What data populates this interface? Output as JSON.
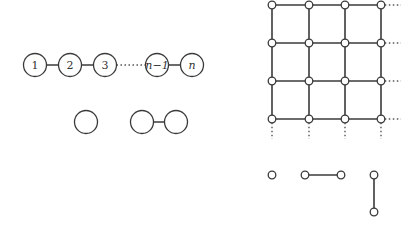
{
  "path_graph": {
    "nodes": [
      {
        "id": "1",
        "label": "1",
        "italic": false,
        "x": 35,
        "y": 65
      },
      {
        "id": "2",
        "label": "2",
        "italic": false,
        "x": 70,
        "y": 65
      },
      {
        "id": "3",
        "label": "3",
        "italic": false,
        "x": 105,
        "y": 65
      },
      {
        "id": "n-1",
        "label": "n−1",
        "italic": true,
        "x": 157,
        "y": 65
      },
      {
        "id": "n",
        "label": "n",
        "italic": true,
        "x": 192,
        "y": 65
      }
    ],
    "edges": [
      [
        "1",
        "2"
      ],
      [
        "2",
        "3"
      ],
      [
        "n-1",
        "n"
      ]
    ],
    "ellipsis_between": [
      "3",
      "n-1"
    ]
  },
  "small_examples_left": {
    "single_node": {
      "x": 86,
      "y": 122
    },
    "edge_pair": [
      {
        "x": 142,
        "y": 122
      },
      {
        "x": 176,
        "y": 122
      }
    ]
  },
  "grid_graph": {
    "columns_x": [
      272,
      309,
      345,
      381
    ],
    "rows_y": [
      5,
      43,
      81,
      119
    ],
    "continues_right": true,
    "continues_down": true
  },
  "small_examples_right": {
    "single_node": {
      "x": 272,
      "y": 175
    },
    "horizontal_edge": [
      {
        "x": 305,
        "y": 175
      },
      {
        "x": 341,
        "y": 175
      }
    ],
    "vertical_edge": [
      {
        "x": 374,
        "y": 175
      },
      {
        "x": 374,
        "y": 212
      }
    ]
  }
}
